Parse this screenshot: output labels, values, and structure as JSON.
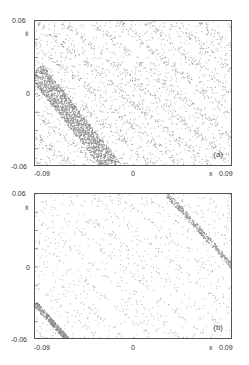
{
  "chart_data": [
    {
      "type": "scatter",
      "panel": "a",
      "title": "",
      "xlabel": "x",
      "ylabel": "ẋ",
      "xlim": [
        -0.09,
        0.09
      ],
      "ylim": [
        -0.06,
        0.06
      ],
      "x_ticks": [
        "-0.09",
        "0",
        "0.09"
      ],
      "y_ticks": [
        "0.06",
        "0",
        "-0.06"
      ],
      "annotation": "(a)",
      "grid": false,
      "description": "Phase-space point density with diagonal stripes running from upper-left to lower-right; a dense shaded band crosses from left edge near x≈-0.09, ẋ≈0.02 to bottom near x≈-0.02, ẋ≈-0.06",
      "dense_band": {
        "x": [
          -0.09,
          -0.02
        ],
        "y": [
          0.02,
          -0.06
        ]
      }
    },
    {
      "type": "scatter",
      "panel": "b",
      "title": "",
      "xlabel": "x",
      "ylabel": "ẋ",
      "xlim": [
        -0.09,
        0.09
      ],
      "ylim": [
        -0.06,
        0.06
      ],
      "x_ticks": [
        "-0.09",
        "0",
        "0.09"
      ],
      "y_ticks": [
        "0.06",
        "0",
        "-0.06"
      ],
      "annotation": "(b)",
      "grid": false,
      "description": "Sparse scattered points with faint diagonal striations; two narrow dense bands, one upper right from x≈0.03, ẋ≈0.06 to right edge, one lower left from x≈-0.09, ẋ≈-0.03 to x≈-0.06, ẋ≈-0.06",
      "dense_bands": [
        {
          "x": [
            0.03,
            0.09
          ],
          "y": [
            0.06,
            0.0
          ]
        },
        {
          "x": [
            -0.09,
            -0.06
          ],
          "y": [
            -0.03,
            -0.06
          ]
        }
      ]
    }
  ],
  "panels": {
    "a": {
      "tag": "(a)",
      "y_top": "0.06",
      "y_label": "ẋ",
      "y_mid": "0",
      "y_bot": "-0.06",
      "x_left": "-0.09",
      "x_mid": "0",
      "x_label": "x",
      "x_right": "0.09"
    },
    "b": {
      "tag": "(b)",
      "y_top": "0.06",
      "y_label": "ẋ",
      "y_mid": "0",
      "y_bot": "-0.06",
      "x_left": "-0.09",
      "x_mid": "0",
      "x_label": "x",
      "x_right": "0.09"
    }
  }
}
